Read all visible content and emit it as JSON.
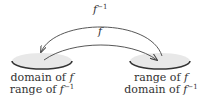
{
  "diagram": {
    "left_set": {
      "line1_prefix": "domain of ",
      "line1_fn": "f",
      "line2_prefix": "range of ",
      "line2_fn": "f",
      "line2_sup": "−1"
    },
    "right_set": {
      "line1_prefix": "range of ",
      "line1_fn": "f",
      "line2_prefix": "domain of ",
      "line2_fn": "f",
      "line2_sup": "−1"
    },
    "arrows": {
      "outer_label_fn": "f",
      "outer_label_sup": "−1",
      "inner_label_fn": "f"
    },
    "colors": {
      "set_fill": "#e8e8e8",
      "set_rim": "#333333",
      "arrow": "#444444",
      "text": "#333333"
    }
  }
}
